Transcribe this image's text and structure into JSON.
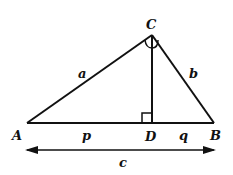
{
  "diagram": {
    "vertices": {
      "A": "A",
      "B": "B",
      "C": "C",
      "D": "D"
    },
    "sides": {
      "a": "a",
      "b": "b",
      "p": "p",
      "q": "q",
      "c": "c"
    },
    "colors": {
      "stroke": "#111111",
      "background": "#ffffff"
    }
  }
}
